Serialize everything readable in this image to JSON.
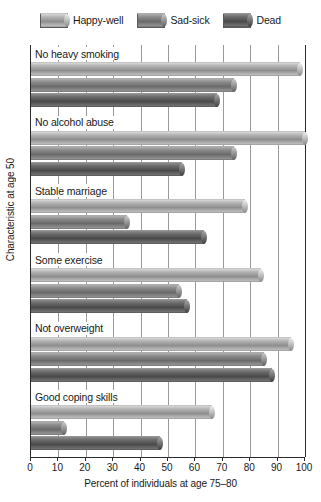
{
  "chart_data": {
    "type": "bar",
    "orientation": "horizontal",
    "title": "",
    "xlabel": "Percent of individuals at age 75–80",
    "ylabel": "Characteristic at age 50",
    "xlim": [
      0,
      100
    ],
    "xticks": [
      0,
      10,
      20,
      30,
      40,
      50,
      60,
      70,
      80,
      90,
      100
    ],
    "xticklabels": [
      "0",
      "10",
      "20",
      "30",
      "40",
      "50",
      "60",
      "70",
      "80",
      "90",
      "100"
    ],
    "grid": true,
    "grid_axis": "x",
    "legend_position": "top",
    "categories": [
      "No heavy smoking",
      "No alcohol abuse",
      "Stable marriage",
      "Some exercise",
      "Not overweight",
      "Good coping skills"
    ],
    "series": [
      {
        "name": "Happy-well",
        "color": "#a8a8a8",
        "values": [
          98,
          100,
          78,
          84,
          95,
          66
        ]
      },
      {
        "name": "Sad-sick",
        "color": "#7d7d7d",
        "values": [
          74,
          74,
          35,
          54,
          85,
          12
        ]
      },
      {
        "name": "Dead",
        "color": "#555555",
        "values": [
          68,
          55,
          63,
          57,
          88,
          47
        ]
      }
    ]
  }
}
